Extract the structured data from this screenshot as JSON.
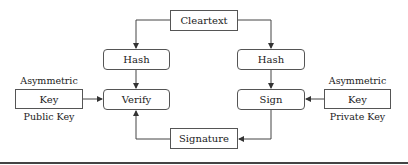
{
  "diagram": {
    "nodes": {
      "cleartext": "Cleartext",
      "hash_left": "Hash",
      "hash_right": "Hash",
      "verify": "Verify",
      "sign": "Sign",
      "signature": "Signature",
      "key_left": "Key",
      "key_right": "Key"
    },
    "labels": {
      "left_top": "Asymmetric",
      "left_bottom": "Public Key",
      "right_top": "Asymmetric",
      "right_bottom": "Private Key"
    },
    "edges": [
      {
        "from": "cleartext",
        "to": "hash_left"
      },
      {
        "from": "cleartext",
        "to": "hash_right"
      },
      {
        "from": "hash_left",
        "to": "verify"
      },
      {
        "from": "hash_right",
        "to": "sign"
      },
      {
        "from": "key_left",
        "to": "verify"
      },
      {
        "from": "key_right",
        "to": "sign"
      },
      {
        "from": "sign",
        "to": "signature"
      },
      {
        "from": "signature",
        "to": "verify"
      }
    ],
    "colors": {
      "line": "#444444",
      "border": "#555555",
      "text": "#222222"
    }
  }
}
